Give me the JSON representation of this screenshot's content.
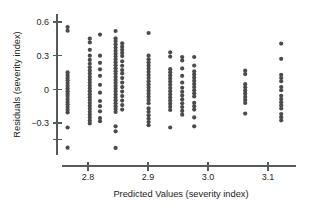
{
  "figure": {
    "background_color": "#ffffff",
    "point_color": "#4b4b4d",
    "axis_color": "#555a5c"
  },
  "axes": {
    "y_title": "Residuals (severity index)",
    "x_title": "Predicted Values (severity index)",
    "y_ticks": [
      "0.6",
      "0.3",
      "0",
      "−0.3"
    ],
    "x_ticks": [
      "2.8",
      "2.9",
      "3.0",
      "3.1"
    ]
  },
  "chart_data": {
    "type": "scatter",
    "title": "",
    "xlabel": "Predicted Values (severity index)",
    "ylabel": "Residuals (severity index)",
    "xlim": [
      2.745,
      3.145
    ],
    "ylim": [
      -0.6,
      0.67
    ],
    "grid": false,
    "legend": null,
    "xticks": [
      2.8,
      2.9,
      3.0,
      3.1
    ],
    "yticks": [
      0.6,
      0.3,
      0.0,
      -0.3
    ],
    "ytick_labels": [
      "0.6",
      "0.3",
      "0",
      "−0.3"
    ],
    "xtick_labels": [
      "2.8",
      "2.9",
      "3.0",
      "3.1"
    ],
    "marker": "filled-circle",
    "marker_size_px": 4.2,
    "series": [
      {
        "name": "residuals",
        "color": "#4b4b4d",
        "points": [
          [
            2.766,
            0.555
          ],
          [
            2.766,
            0.522
          ],
          [
            2.766,
            0.152
          ],
          [
            2.766,
            0.128
          ],
          [
            2.766,
            0.104
          ],
          [
            2.766,
            0.08
          ],
          [
            2.766,
            0.056
          ],
          [
            2.766,
            0.032
          ],
          [
            2.766,
            0.008
          ],
          [
            2.766,
            -0.016
          ],
          [
            2.766,
            -0.04
          ],
          [
            2.766,
            -0.06
          ],
          [
            2.766,
            -0.086
          ],
          [
            2.766,
            -0.11
          ],
          [
            2.766,
            -0.134
          ],
          [
            2.766,
            -0.158
          ],
          [
            2.766,
            -0.182
          ],
          [
            2.766,
            -0.206
          ],
          [
            2.766,
            -0.34
          ],
          [
            2.766,
            -0.52
          ],
          [
            2.803,
            0.452
          ],
          [
            2.803,
            0.418
          ],
          [
            2.803,
            0.352
          ],
          [
            2.803,
            0.3
          ],
          [
            2.803,
            0.262
          ],
          [
            2.803,
            0.228
          ],
          [
            2.803,
            0.196
          ],
          [
            2.803,
            0.168
          ],
          [
            2.803,
            0.14
          ],
          [
            2.803,
            0.112
          ],
          [
            2.803,
            0.086
          ],
          [
            2.803,
            0.06
          ],
          [
            2.803,
            0.034
          ],
          [
            2.803,
            0.008
          ],
          [
            2.803,
            -0.018
          ],
          [
            2.803,
            -0.044
          ],
          [
            2.803,
            -0.07
          ],
          [
            2.803,
            -0.096
          ],
          [
            2.803,
            -0.122
          ],
          [
            2.803,
            -0.148
          ],
          [
            2.803,
            -0.174
          ],
          [
            2.803,
            -0.2
          ],
          [
            2.803,
            -0.226
          ],
          [
            2.803,
            -0.252
          ],
          [
            2.803,
            -0.278
          ],
          [
            2.803,
            -0.304
          ],
          [
            2.82,
            0.488
          ],
          [
            2.82,
            0.3
          ],
          [
            2.82,
            0.236
          ],
          [
            2.82,
            0.178
          ],
          [
            2.82,
            0.12
          ],
          [
            2.82,
            0.04
          ],
          [
            2.82,
            -0.03
          ],
          [
            2.82,
            -0.104
          ],
          [
            2.82,
            -0.15
          ],
          [
            2.82,
            -0.196
          ],
          [
            2.82,
            -0.256
          ],
          [
            2.82,
            -0.284
          ],
          [
            2.846,
            0.52
          ],
          [
            2.846,
            0.454
          ],
          [
            2.846,
            0.43
          ],
          [
            2.846,
            0.402
          ],
          [
            2.846,
            0.372
          ],
          [
            2.846,
            0.344
          ],
          [
            2.846,
            0.318
          ],
          [
            2.846,
            0.292
          ],
          [
            2.846,
            0.266
          ],
          [
            2.846,
            0.24
          ],
          [
            2.846,
            0.214
          ],
          [
            2.846,
            0.188
          ],
          [
            2.846,
            0.162
          ],
          [
            2.846,
            0.136
          ],
          [
            2.846,
            0.11
          ],
          [
            2.846,
            0.084
          ],
          [
            2.846,
            0.058
          ],
          [
            2.846,
            0.032
          ],
          [
            2.846,
            0.006
          ],
          [
            2.846,
            -0.02
          ],
          [
            2.846,
            -0.046
          ],
          [
            2.846,
            -0.072
          ],
          [
            2.846,
            -0.098
          ],
          [
            2.846,
            -0.124
          ],
          [
            2.846,
            -0.15
          ],
          [
            2.846,
            -0.176
          ],
          [
            2.846,
            -0.202
          ],
          [
            2.846,
            -0.33
          ],
          [
            2.846,
            -0.374
          ],
          [
            2.846,
            -0.522
          ],
          [
            2.857,
            0.41
          ],
          [
            2.857,
            0.38
          ],
          [
            2.857,
            0.352
          ],
          [
            2.857,
            0.324
          ],
          [
            2.857,
            0.296
          ],
          [
            2.857,
            0.25
          ],
          [
            2.857,
            0.21
          ],
          [
            2.857,
            0.172
          ],
          [
            2.857,
            0.142
          ],
          [
            2.857,
            0.1
          ],
          [
            2.857,
            0.06
          ],
          [
            2.857,
            0.02
          ],
          [
            2.857,
            -0.02
          ],
          [
            2.857,
            -0.06
          ],
          [
            2.857,
            -0.1
          ],
          [
            2.857,
            -0.14
          ],
          [
            2.857,
            -0.18
          ],
          [
            2.901,
            0.502
          ],
          [
            2.901,
            0.3
          ],
          [
            2.901,
            0.268
          ],
          [
            2.901,
            0.24
          ],
          [
            2.901,
            0.212
          ],
          [
            2.901,
            0.184
          ],
          [
            2.901,
            0.156
          ],
          [
            2.901,
            0.128
          ],
          [
            2.901,
            0.1
          ],
          [
            2.901,
            0.072
          ],
          [
            2.901,
            0.044
          ],
          [
            2.901,
            0.016
          ],
          [
            2.901,
            -0.012
          ],
          [
            2.901,
            -0.04
          ],
          [
            2.901,
            -0.068
          ],
          [
            2.901,
            -0.096
          ],
          [
            2.901,
            -0.124
          ],
          [
            2.901,
            -0.17
          ],
          [
            2.901,
            -0.2
          ],
          [
            2.901,
            -0.232
          ],
          [
            2.901,
            -0.262
          ],
          [
            2.901,
            -0.292
          ],
          [
            2.901,
            -0.32
          ],
          [
            2.937,
            0.33
          ],
          [
            2.937,
            0.292
          ],
          [
            2.937,
            0.18
          ],
          [
            2.937,
            0.152
          ],
          [
            2.937,
            0.124
          ],
          [
            2.937,
            0.096
          ],
          [
            2.937,
            0.068
          ],
          [
            2.937,
            0.04
          ],
          [
            2.937,
            0.012
          ],
          [
            2.937,
            -0.016
          ],
          [
            2.937,
            -0.044
          ],
          [
            2.937,
            -0.072
          ],
          [
            2.937,
            -0.1
          ],
          [
            2.937,
            -0.128
          ],
          [
            2.937,
            -0.156
          ],
          [
            2.937,
            -0.184
          ],
          [
            2.937,
            -0.34
          ],
          [
            2.957,
            0.288
          ],
          [
            2.957,
            0.258
          ],
          [
            2.957,
            0.186
          ],
          [
            2.957,
            0.12
          ],
          [
            2.957,
            0.06
          ],
          [
            2.957,
            0.014
          ],
          [
            2.957,
            -0.022
          ],
          [
            2.957,
            -0.056
          ],
          [
            2.957,
            -0.09
          ],
          [
            2.957,
            -0.124
          ],
          [
            2.957,
            -0.158
          ],
          [
            2.957,
            -0.192
          ],
          [
            2.957,
            -0.226
          ],
          [
            2.977,
            0.288
          ],
          [
            2.977,
            0.212
          ],
          [
            2.977,
            0.16
          ],
          [
            2.977,
            0.132
          ],
          [
            2.977,
            0.104
          ],
          [
            2.977,
            0.076
          ],
          [
            2.977,
            0.048
          ],
          [
            2.977,
            0.02
          ],
          [
            2.977,
            -0.008
          ],
          [
            2.977,
            -0.036
          ],
          [
            2.977,
            -0.064
          ],
          [
            2.977,
            -0.12
          ],
          [
            2.977,
            -0.15
          ],
          [
            2.977,
            -0.18
          ],
          [
            2.977,
            -0.25
          ],
          [
            2.977,
            -0.33
          ],
          [
            3.062,
            0.166
          ],
          [
            3.062,
            0.136
          ],
          [
            3.062,
            0.046
          ],
          [
            3.062,
            0.018
          ],
          [
            3.062,
            -0.01
          ],
          [
            3.062,
            -0.038
          ],
          [
            3.062,
            -0.066
          ],
          [
            3.062,
            -0.094
          ],
          [
            3.062,
            -0.122
          ],
          [
            3.062,
            -0.216
          ],
          [
            3.122,
            0.408
          ],
          [
            3.122,
            0.272
          ],
          [
            3.122,
            0.128
          ],
          [
            3.122,
            0.1
          ],
          [
            3.122,
            0.072
          ],
          [
            3.122,
            0.02
          ],
          [
            3.122,
            -0.008
          ],
          [
            3.122,
            -0.058
          ],
          [
            3.122,
            -0.086
          ],
          [
            3.122,
            -0.114
          ],
          [
            3.122,
            -0.142
          ],
          [
            3.122,
            -0.17
          ],
          [
            3.122,
            -0.22
          ],
          [
            3.122,
            -0.248
          ],
          [
            3.122,
            -0.276
          ]
        ]
      }
    ]
  }
}
